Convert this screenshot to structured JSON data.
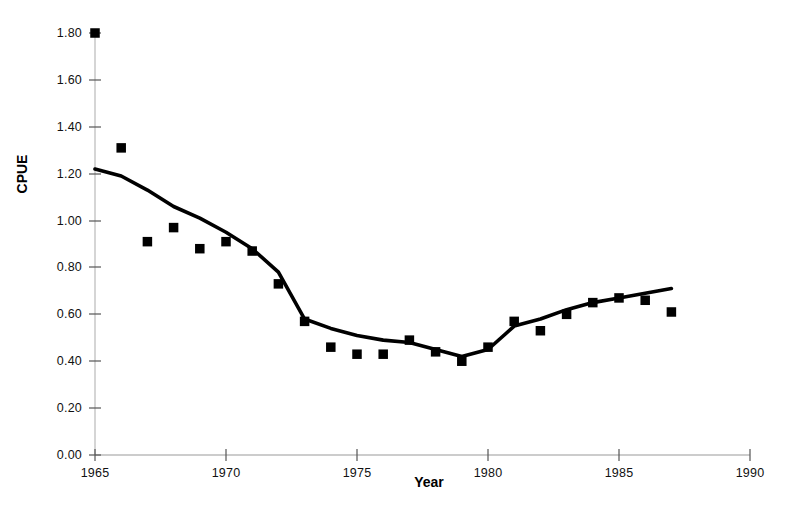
{
  "chart_data": {
    "type": "scatter",
    "title": "",
    "subtitle": "",
    "xlabel": "Year",
    "ylabel": "CPUE",
    "xlim": [
      1965,
      1990
    ],
    "ylim": [
      0.0,
      1.8
    ],
    "grid": false,
    "legend": null,
    "x": [
      1965,
      1966,
      1967,
      1968,
      1969,
      1970,
      1971,
      1972,
      1973,
      1974,
      1975,
      1976,
      1977,
      1978,
      1979,
      1980,
      1981,
      1982,
      1983,
      1984,
      1985,
      1986,
      1987
    ],
    "xticks": [
      1965,
      1970,
      1975,
      1980,
      1985,
      1990
    ],
    "xtick_labels": [
      "1965",
      "1970",
      "1975",
      "1980",
      "1985",
      "1990"
    ],
    "yticks": [
      0.0,
      0.2,
      0.4,
      0.6,
      0.8,
      1.0,
      1.2,
      1.4,
      1.6,
      1.8
    ],
    "ytick_labels": [
      "0.00",
      "0.20",
      "0.40",
      "0.60",
      "0.80",
      "1.00",
      "1.20",
      "1.40",
      "1.60",
      "1.80"
    ],
    "series": [
      {
        "name": "observed-cpue",
        "type": "scatter",
        "marker": "square",
        "color": "#000000",
        "values": [
          1.8,
          1.31,
          0.91,
          0.97,
          0.88,
          0.91,
          0.87,
          0.73,
          0.57,
          0.46,
          0.43,
          0.43,
          0.49,
          0.44,
          0.4,
          0.46,
          0.57,
          0.53,
          0.6,
          0.65,
          0.67,
          0.66,
          0.61
        ]
      },
      {
        "name": "fitted-cpue-line",
        "type": "line",
        "color": "#000000",
        "values": [
          1.22,
          1.19,
          1.13,
          1.06,
          1.01,
          0.95,
          0.88,
          0.78,
          0.58,
          0.54,
          0.51,
          0.49,
          0.48,
          0.45,
          0.42,
          0.45,
          0.55,
          0.58,
          0.62,
          0.65,
          0.67,
          0.69,
          0.71
        ]
      }
    ]
  },
  "axes": {
    "y_title": "CPUE",
    "x_title": "Year"
  }
}
